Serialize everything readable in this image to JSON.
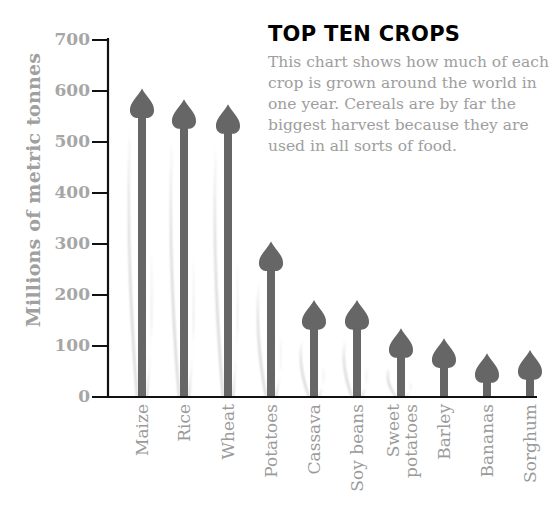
{
  "chart_data": {
    "type": "bar",
    "title": "TOP TEN CROPS",
    "subtitle": "This chart shows how much of each crop is grown around the world in one year. Cereals are by far the biggest harvest because they are used in all sorts of food.",
    "xlabel": "",
    "ylabel": "Millions of metric tonnes",
    "ylim": [
      0,
      700
    ],
    "yticks": [
      0,
      100,
      200,
      300,
      400,
      500,
      600,
      700
    ],
    "grid": false,
    "legend": null,
    "categories": [
      "Maize",
      "Rice",
      "Wheat",
      "Potatoes",
      "Cassava",
      "Soy beans",
      "Sweet potatoes",
      "Barley",
      "Bananas",
      "Sorghum"
    ],
    "values": [
      605,
      584,
      574,
      305,
      190,
      190,
      135,
      115,
      86,
      92
    ],
    "colors": {
      "arrow": "#666666",
      "shadow": "#d4d4d4",
      "axis": "#111111",
      "tick_label": "#a6a6a6",
      "category_label": "#9a9a9a",
      "title": "#000000",
      "body_text": "#9e9e9e"
    }
  },
  "header": {
    "title": "TOP TEN CROPS",
    "description": "This chart shows how much of each crop is grown around the world in one year. Cereals are by far the biggest harvest because they are used in all sorts of food."
  },
  "axis": {
    "ylabel": "Millions of metric tonnes",
    "ticks": [
      "0",
      "100",
      "200",
      "300",
      "400",
      "500",
      "600",
      "700"
    ]
  },
  "labels": {
    "c0": "Maize",
    "c1": "Rice",
    "c2": "Wheat",
    "c3": "Potatoes",
    "c4": "Cassava",
    "c5": "Soy beans",
    "c6a": "Sweet",
    "c6b": "potatoes",
    "c7": "Barley",
    "c8": "Bananas",
    "c9": "Sorghum"
  }
}
